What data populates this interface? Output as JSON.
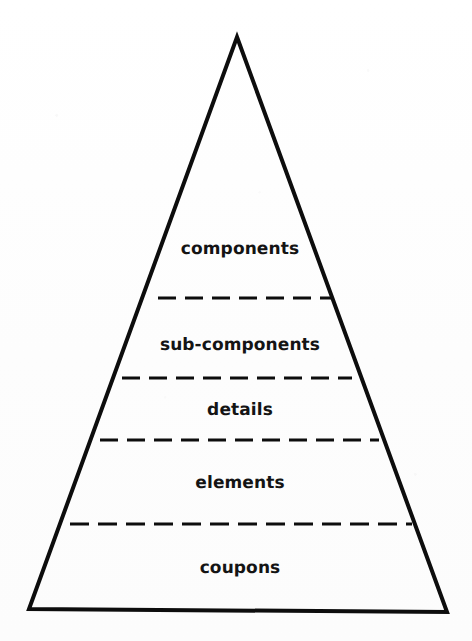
{
  "diagram": {
    "type": "pyramid-hierarchy",
    "shape": "triangle",
    "background_color": "#ffffff",
    "stroke_color": "#0d0d0d",
    "text_color": "#141414",
    "outline_width_px": 4,
    "divider_style": "dashed",
    "divider_width_px": 3,
    "apex": {
      "x": 237,
      "y": 37
    },
    "base_left": {
      "x": 29,
      "y": 609
    },
    "base_right": {
      "x": 447,
      "y": 612
    },
    "tiers": [
      {
        "label": "components",
        "level": 1,
        "label_x": 240,
        "label_y": 249,
        "font_size_px": 17
      },
      {
        "label": "sub-components",
        "level": 2,
        "label_x": 240,
        "label_y": 345,
        "font_size_px": 17
      },
      {
        "label": "details",
        "level": 3,
        "label_x": 240,
        "label_y": 410,
        "font_size_px": 17
      },
      {
        "label": "elements",
        "level": 4,
        "label_x": 240,
        "label_y": 483,
        "font_size_px": 17
      },
      {
        "label": "coupons",
        "level": 5,
        "label_x": 240,
        "label_y": 568,
        "font_size_px": 17
      }
    ],
    "dividers": [
      {
        "index": 1,
        "y": 298,
        "x1": 158,
        "x2": 331,
        "separates": "components / sub-components"
      },
      {
        "index": 2,
        "y": 378,
        "x1": 122,
        "x2": 352,
        "separates": "sub-components / details"
      },
      {
        "index": 3,
        "y": 440,
        "x1": 100,
        "x2": 379,
        "separates": "details / elements"
      },
      {
        "index": 4,
        "y": 524,
        "x1": 70,
        "x2": 412,
        "separates": "elements / coupons"
      }
    ]
  }
}
